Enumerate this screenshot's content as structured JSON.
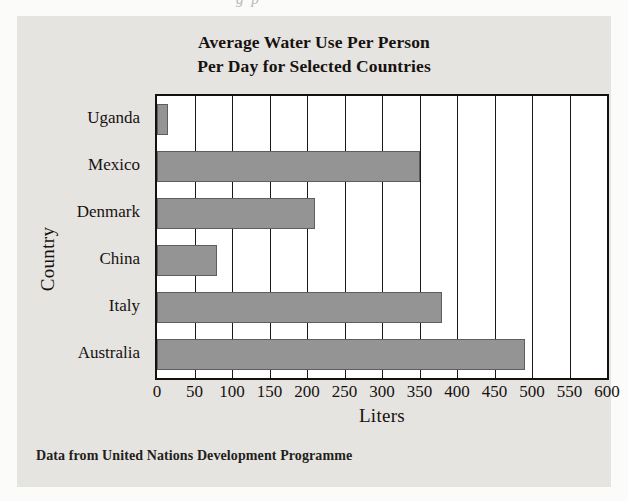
{
  "scan_artifact": "g p",
  "figure": {
    "title_lines": [
      "Average Water Use Per Person",
      "Per Day for Selected Countries"
    ],
    "source_note": "Data from United Nations Development Programme",
    "colors": {
      "panel_background": "#e6e4e1",
      "plot_background": "#ffffff",
      "bar_fill": "#949494",
      "bar_stroke": "#5e5e5e",
      "axis": "#15110e",
      "text": "#16120f"
    }
  },
  "chart_data": {
    "type": "bar",
    "orientation": "horizontal",
    "xlabel": "Liters",
    "ylabel": "Country",
    "categories": [
      "Uganda",
      "Mexico",
      "Denmark",
      "China",
      "Italy",
      "Australia"
    ],
    "values": [
      15,
      350,
      210,
      80,
      380,
      490
    ],
    "series": [
      {
        "name": "Average water use per person per day (liters)",
        "values": [
          15,
          350,
          210,
          80,
          380,
          490
        ]
      }
    ],
    "xlim": [
      0,
      600
    ],
    "xticks": [
      0,
      50,
      100,
      150,
      200,
      250,
      300,
      350,
      400,
      450,
      500,
      550,
      600
    ],
    "xtick_labels": [
      "0",
      "50",
      "100",
      "150",
      "200",
      "250",
      "300",
      "350",
      "400",
      "450",
      "500",
      "550",
      "600"
    ],
    "grid": true,
    "grid_axis": "x",
    "legend": false,
    "annotations": [
      "Data from United Nations Development Programme"
    ]
  }
}
